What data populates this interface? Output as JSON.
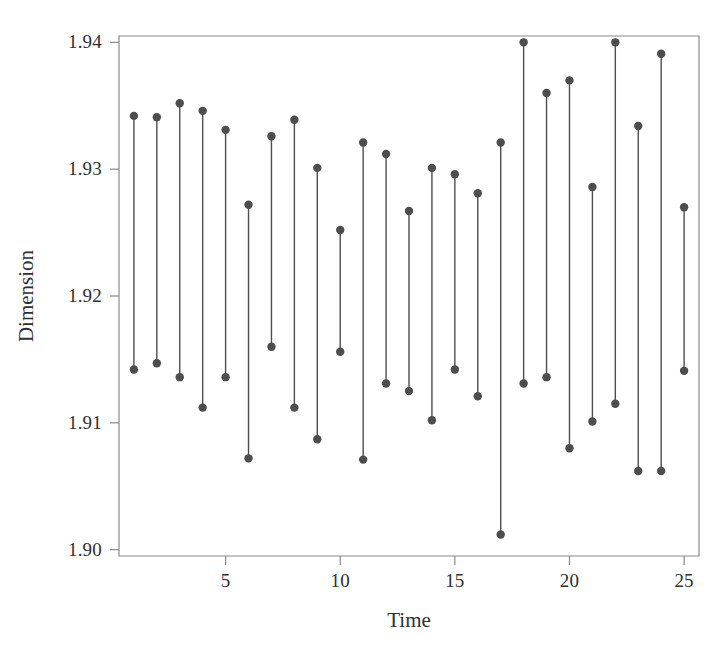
{
  "chart_data": {
    "type": "line",
    "style": "range-interval-plot",
    "title": "",
    "xlabel": "Time",
    "ylabel": "Dimension",
    "xlim": [
      0.35,
      25.65
    ],
    "ylim": [
      1.8995,
      1.9405
    ],
    "grid": false,
    "legend": null,
    "xticks": [
      5,
      10,
      15,
      20,
      25
    ],
    "xtick_labels": [
      "5",
      "10",
      "15",
      "20",
      "25"
    ],
    "yticks": [
      1.9,
      1.91,
      1.92,
      1.93,
      1.94
    ],
    "ytick_labels": [
      "1.90",
      "1.91",
      "1.92",
      "1.93",
      "1.94"
    ],
    "marker_color": "#4d4d4d",
    "line_color": "#4d4d4d",
    "axis_color": "#8a8a8a",
    "background": "#ffffff",
    "x": [
      1,
      2,
      3,
      4,
      5,
      6,
      7,
      8,
      9,
      10,
      11,
      12,
      13,
      14,
      15,
      16,
      17,
      18,
      19,
      20,
      21,
      22,
      23,
      24,
      25
    ],
    "series": [
      {
        "name": "Maximum",
        "values": [
          1.9342,
          1.9341,
          1.9352,
          1.9346,
          1.9331,
          1.9272,
          1.9326,
          1.9339,
          1.9301,
          1.9252,
          1.9321,
          1.9312,
          1.9267,
          1.9301,
          1.9296,
          1.9281,
          1.9321,
          1.94,
          1.936,
          1.937,
          1.9286,
          1.94,
          1.9334,
          1.9391,
          1.927
        ]
      },
      {
        "name": "Minimum",
        "values": [
          1.9142,
          1.9147,
          1.9136,
          1.9112,
          1.9136,
          1.9072,
          1.916,
          1.9112,
          1.9087,
          1.9156,
          1.9071,
          1.9131,
          1.9125,
          1.9102,
          1.9142,
          1.9121,
          1.9012,
          1.9131,
          1.9136,
          1.908,
          1.9101,
          1.9115,
          1.9062,
          1.9062,
          1.9141
        ]
      }
    ]
  },
  "axis_titles": {
    "x": "Time",
    "y": "Dimension"
  }
}
